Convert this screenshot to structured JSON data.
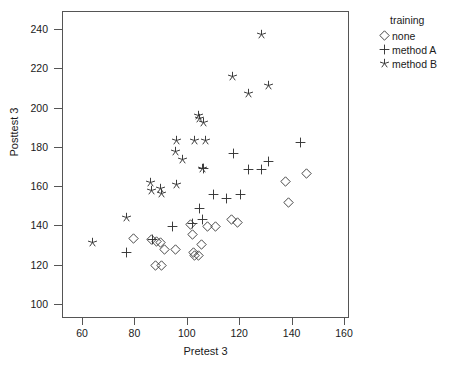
{
  "chart_data": {
    "type": "scatter",
    "title": "",
    "xlabel": "Pretest 3",
    "ylabel": "Posttest 3",
    "xlim": [
      50,
      168
    ],
    "ylim": [
      92,
      248
    ],
    "xticks": [
      60,
      80,
      100,
      120,
      140,
      160
    ],
    "yticks": [
      100,
      120,
      140,
      160,
      180,
      200,
      220,
      240
    ],
    "grid": false,
    "legend": {
      "title": "training",
      "position": "right",
      "entries": [
        {
          "name": "none",
          "marker": "diamond-open-icon",
          "label": "none"
        },
        {
          "name": "method A",
          "marker": "plus-icon",
          "label": "method A"
        },
        {
          "name": "method B",
          "marker": "asterisk-star-icon",
          "label": "method B"
        }
      ]
    },
    "series": [
      {
        "name": "none",
        "marker": "diamond",
        "points": [
          [
            79.5,
            133.5
          ],
          [
            86.5,
            133.0
          ],
          [
            88.5,
            132.0
          ],
          [
            90.0,
            131.5
          ],
          [
            91.5,
            128.0
          ],
          [
            95.5,
            127.5
          ],
          [
            88.0,
            119.5
          ],
          [
            90.5,
            119.5
          ],
          [
            101.5,
            140.5
          ],
          [
            102.0,
            135.5
          ],
          [
            102.5,
            126.0
          ],
          [
            103.0,
            124.5
          ],
          [
            104.5,
            124.5
          ],
          [
            105.5,
            130.5
          ],
          [
            108.0,
            139.5
          ],
          [
            111.0,
            139.5
          ],
          [
            117.0,
            143.0
          ],
          [
            119.5,
            141.5
          ],
          [
            137.5,
            162.5
          ],
          [
            139.0,
            151.5
          ],
          [
            145.5,
            166.5
          ]
        ]
      },
      {
        "name": "method A",
        "marker": "plus",
        "points": [
          [
            77.0,
            126.0
          ],
          [
            87.0,
            133.0
          ],
          [
            94.5,
            139.5
          ],
          [
            102.0,
            141.0
          ],
          [
            105.0,
            148.5
          ],
          [
            106.0,
            143.0
          ],
          [
            106.5,
            169.0
          ],
          [
            110.0,
            155.5
          ],
          [
            115.0,
            153.5
          ],
          [
            118.0,
            176.5
          ],
          [
            120.5,
            155.5
          ],
          [
            123.5,
            168.5
          ],
          [
            128.5,
            168.5
          ],
          [
            131.0,
            172.5
          ],
          [
            143.5,
            182.0
          ]
        ]
      },
      {
        "name": "method B",
        "marker": "star",
        "points": [
          [
            64.0,
            131.5
          ],
          [
            77.0,
            144.0
          ],
          [
            86.0,
            162.0
          ],
          [
            86.5,
            158.0
          ],
          [
            90.0,
            159.0
          ],
          [
            90.5,
            156.5
          ],
          [
            96.0,
            161.0
          ],
          [
            96.0,
            183.0
          ],
          [
            95.5,
            177.5
          ],
          [
            98.5,
            173.5
          ],
          [
            103.0,
            183.0
          ],
          [
            107.0,
            183.0
          ],
          [
            104.5,
            196.0
          ],
          [
            105.0,
            194.5
          ],
          [
            106.5,
            192.5
          ],
          [
            106.0,
            169.0
          ],
          [
            117.5,
            216.0
          ],
          [
            123.5,
            207.0
          ],
          [
            128.5,
            237.0
          ],
          [
            131.0,
            211.0
          ]
        ]
      }
    ]
  }
}
